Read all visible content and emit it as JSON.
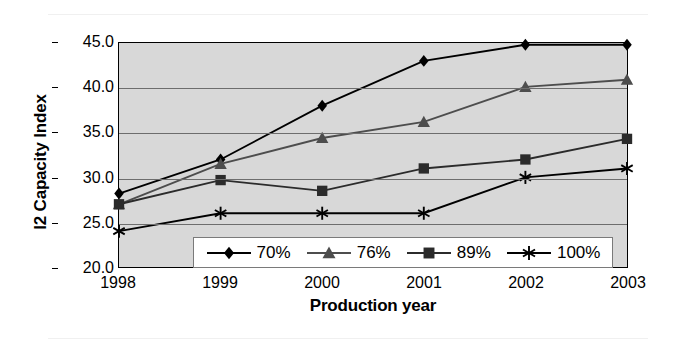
{
  "chart_data": {
    "type": "line",
    "title": "",
    "xlabel": "Production year",
    "ylabel": "I2 Capacity Index",
    "categories": [
      "1998",
      "1999",
      "2000",
      "2001",
      "2002",
      "2003"
    ],
    "x": [
      1998,
      1999,
      2000,
      2001,
      2002,
      2003
    ],
    "xlim": [
      1998,
      2003
    ],
    "ylim": [
      20.0,
      45.0
    ],
    "ytick_labels": [
      "20.0",
      "25.0",
      "30.0",
      "35.0",
      "40.0",
      "45.0"
    ],
    "yticks": [
      20.0,
      25.0,
      30.0,
      35.0,
      40.0,
      45.0
    ],
    "grid": "horizontal",
    "legend_position": "bottom-center-inside",
    "plot_background": "#d8d8d8",
    "series": [
      {
        "name": "70%",
        "marker": "diamond",
        "color": "#000000",
        "values": [
          28.2,
          32.0,
          38.0,
          43.0,
          44.8,
          44.8
        ]
      },
      {
        "name": "76%",
        "marker": "triangle",
        "color": "#4d4d4d",
        "values": [
          27.0,
          31.5,
          34.4,
          36.2,
          40.1,
          40.9
        ]
      },
      {
        "name": "89%",
        "marker": "square",
        "color": "#2b2b2b",
        "values": [
          27.0,
          29.7,
          28.5,
          31.0,
          32.0,
          34.3
        ]
      },
      {
        "name": "100%",
        "marker": "asterisk",
        "color": "#000000",
        "values": [
          24.0,
          26.0,
          26.0,
          26.0,
          30.0,
          31.0
        ]
      }
    ]
  },
  "axis": {
    "y_title": "I2 Capacity Index",
    "x_title": "Production year"
  },
  "legend": {
    "items": [
      {
        "label": "70%",
        "marker": "diamond"
      },
      {
        "label": "76%",
        "marker": "triangle"
      },
      {
        "label": "89%",
        "marker": "square"
      },
      {
        "label": "100%",
        "marker": "asterisk"
      }
    ]
  }
}
